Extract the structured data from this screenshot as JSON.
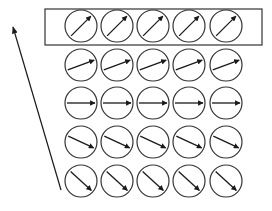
{
  "diagram": {
    "colors": {
      "stroke": "#333333",
      "arrow": "#1a1a1a",
      "background": "#ffffff"
    },
    "grid": {
      "columns": 5,
      "rows": 5,
      "col_centers_x": [
        81,
        117,
        153,
        189,
        226
      ],
      "row_centers_y": [
        26,
        65,
        103,
        142,
        181
      ],
      "circle_radius": 16,
      "row_arrow_angles_deg": [
        45,
        20,
        0,
        -25,
        -42
      ]
    },
    "highlight_box": {
      "label": "top-row-box",
      "x": 45,
      "y": 9,
      "width": 217,
      "height": 36
    },
    "side_arrow": {
      "from": [
        61,
        190
      ],
      "to": [
        13,
        27
      ],
      "direction": "up"
    },
    "caption": {
      "text": "",
      "note": "caption at bottom is clipped; only tops of glyphs visible"
    }
  }
}
